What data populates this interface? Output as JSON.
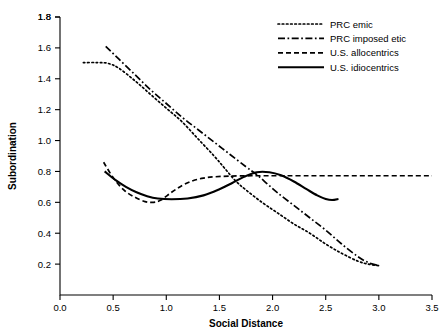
{
  "chart_data": {
    "type": "line",
    "title": "",
    "xlabel": "Social Distance",
    "ylabel": "Subordination",
    "xlim": [
      0.0,
      3.5
    ],
    "ylim": [
      0.0,
      1.8
    ],
    "grid": false,
    "legend_position": "top-right",
    "xticks": [
      "0.0",
      "0.5",
      "1.0",
      "1.5",
      "2.0",
      "2.5",
      "3.0",
      "3.5"
    ],
    "xtick_values": [
      0.0,
      0.5,
      1.0,
      1.5,
      2.0,
      2.5,
      3.0,
      3.5
    ],
    "yticks": [
      "0.2",
      "0.4",
      "0.6",
      "0.8",
      "1.0",
      "1.2",
      "1.4",
      "1.6",
      "1.8"
    ],
    "ytick_values": [
      0.2,
      0.4,
      0.6,
      0.8,
      1.0,
      1.2,
      1.4,
      1.6,
      1.8
    ],
    "series": [
      {
        "name": "PRC emic",
        "style": "dotted",
        "dash": "1.6,2.6",
        "width": 1.7,
        "points": [
          [
            0.22,
            1.505
          ],
          [
            0.35,
            1.505
          ],
          [
            0.45,
            1.5
          ],
          [
            0.55,
            1.47
          ],
          [
            0.7,
            1.39
          ],
          [
            0.85,
            1.3
          ],
          [
            1.0,
            1.21
          ],
          [
            1.15,
            1.12
          ],
          [
            1.3,
            1.01
          ],
          [
            1.45,
            0.9
          ],
          [
            1.55,
            0.82
          ],
          [
            1.65,
            0.74
          ],
          [
            1.75,
            0.68
          ],
          [
            1.9,
            0.6
          ],
          [
            2.05,
            0.53
          ],
          [
            2.2,
            0.46
          ],
          [
            2.35,
            0.4
          ],
          [
            2.5,
            0.33
          ],
          [
            2.65,
            0.27
          ],
          [
            2.8,
            0.22
          ],
          [
            2.9,
            0.2
          ],
          [
            3.0,
            0.19
          ]
        ]
      },
      {
        "name": "PRC imposed etic",
        "style": "dash-dot",
        "dash": "7,2.5,1.7,2.5",
        "width": 1.7,
        "points": [
          [
            0.43,
            1.61
          ],
          [
            0.55,
            1.53
          ],
          [
            0.7,
            1.43
          ],
          [
            0.85,
            1.33
          ],
          [
            1.0,
            1.24
          ],
          [
            1.15,
            1.15
          ],
          [
            1.3,
            1.07
          ],
          [
            1.45,
            0.99
          ],
          [
            1.6,
            0.91
          ],
          [
            1.75,
            0.83
          ],
          [
            1.85,
            0.78
          ],
          [
            1.95,
            0.72
          ],
          [
            2.05,
            0.66
          ],
          [
            2.2,
            0.58
          ],
          [
            2.35,
            0.5
          ],
          [
            2.5,
            0.42
          ],
          [
            2.65,
            0.33
          ],
          [
            2.8,
            0.25
          ],
          [
            2.9,
            0.21
          ],
          [
            3.0,
            0.19
          ]
        ]
      },
      {
        "name": "U.S. allocentrics",
        "style": "dashed",
        "dash": "5,3",
        "width": 1.7,
        "points": [
          [
            0.41,
            0.86
          ],
          [
            0.5,
            0.76
          ],
          [
            0.6,
            0.68
          ],
          [
            0.7,
            0.635
          ],
          [
            0.8,
            0.605
          ],
          [
            0.88,
            0.6
          ],
          [
            0.95,
            0.615
          ],
          [
            1.05,
            0.665
          ],
          [
            1.15,
            0.71
          ],
          [
            1.25,
            0.74
          ],
          [
            1.35,
            0.757
          ],
          [
            1.45,
            0.765
          ],
          [
            1.6,
            0.77
          ],
          [
            1.8,
            0.772
          ],
          [
            2.1,
            0.772
          ],
          [
            2.5,
            0.772
          ],
          [
            3.0,
            0.772
          ],
          [
            3.5,
            0.772
          ]
        ]
      },
      {
        "name": "U.S. idiocentrics",
        "style": "solid",
        "dash": "none",
        "width": 2.1,
        "points": [
          [
            0.42,
            0.8
          ],
          [
            0.52,
            0.745
          ],
          [
            0.62,
            0.7
          ],
          [
            0.72,
            0.665
          ],
          [
            0.82,
            0.64
          ],
          [
            0.92,
            0.625
          ],
          [
            1.05,
            0.62
          ],
          [
            1.2,
            0.625
          ],
          [
            1.35,
            0.645
          ],
          [
            1.5,
            0.685
          ],
          [
            1.62,
            0.725
          ],
          [
            1.73,
            0.765
          ],
          [
            1.85,
            0.795
          ],
          [
            1.97,
            0.795
          ],
          [
            2.08,
            0.775
          ],
          [
            2.2,
            0.735
          ],
          [
            2.32,
            0.685
          ],
          [
            2.42,
            0.645
          ],
          [
            2.5,
            0.622
          ],
          [
            2.56,
            0.615
          ],
          [
            2.62,
            0.622
          ]
        ]
      }
    ]
  },
  "legend": {
    "items": [
      {
        "label": "PRC emic"
      },
      {
        "label": "PRC imposed etic"
      },
      {
        "label": "U.S. allocentrics"
      },
      {
        "label": "U.S. idiocentrics"
      }
    ]
  },
  "axes": {
    "x_title": "Social Distance",
    "y_title": "Subordination"
  }
}
